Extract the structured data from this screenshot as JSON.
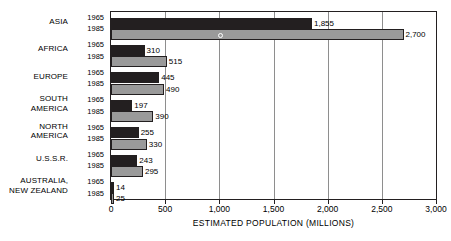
{
  "chart_data": {
    "type": "bar",
    "orientation": "horizontal",
    "title": "",
    "xlabel": "ESTIMATED POPULATION (MILLIONS)",
    "ylabel": "",
    "xlim": [
      0,
      3000
    ],
    "xticks": [
      0,
      500,
      1000,
      1500,
      2000,
      2500,
      3000
    ],
    "xtick_labels": [
      "0",
      "500",
      "1,000",
      "1,500",
      "2,000",
      "2,500",
      "3,000"
    ],
    "grid": true,
    "legend_position": "none",
    "categories": [
      "ASIA",
      "AFRICA",
      "EUROPE",
      "SOUTH AMERICA",
      "NORTH AMERICA",
      "U.S.S.R.",
      "AUSTRALIA, NEW ZEALAND"
    ],
    "series": [
      {
        "name": "1965",
        "color": "#231f20",
        "values": [
          1855,
          310,
          445,
          197,
          255,
          243,
          14
        ],
        "labels": [
          "1,855",
          "310",
          "445",
          "197",
          "255",
          "243",
          "14"
        ]
      },
      {
        "name": "1985",
        "color": "#9a9a9a",
        "values": [
          2700,
          515,
          490,
          390,
          330,
          295,
          25
        ],
        "labels": [
          "2,700",
          "515",
          "490",
          "390",
          "330",
          "295",
          "25"
        ]
      }
    ]
  },
  "rows": [
    {
      "name_lines": [
        "ASIA"
      ],
      "years": [
        "1965",
        "1985"
      ]
    },
    {
      "name_lines": [
        "AFRICA"
      ],
      "years": [
        "1965",
        "1985"
      ]
    },
    {
      "name_lines": [
        "EUROPE"
      ],
      "years": [
        "1965",
        "1985"
      ]
    },
    {
      "name_lines": [
        "SOUTH",
        "AMERICA"
      ],
      "years": [
        "1965",
        "1985"
      ]
    },
    {
      "name_lines": [
        "NORTH",
        "AMERICA"
      ],
      "years": [
        "1965",
        "1985"
      ]
    },
    {
      "name_lines": [
        "U.S.S.R."
      ],
      "years": [
        "1965",
        "1985"
      ]
    },
    {
      "name_lines": [
        "AUSTRALIA,",
        "NEW ZEALAND"
      ],
      "years": [
        "1965",
        "1985"
      ]
    }
  ]
}
